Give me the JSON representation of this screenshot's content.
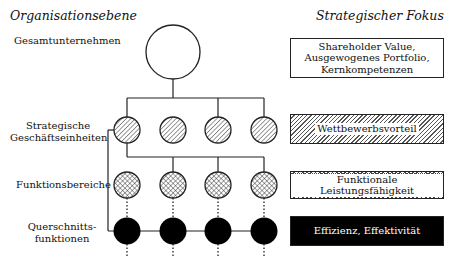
{
  "headings": {
    "left": "Organisationsebene",
    "right": "Strategischer Fokus"
  },
  "levels": [
    {
      "label": "Gesamtunternehmen",
      "fill": "white",
      "count": 1
    },
    {
      "label_line1": "Strategische",
      "label_line2": "Geschäftseinheiten",
      "fill": "diagonal-hatch",
      "count": 4
    },
    {
      "label": "Funktionsbereiche",
      "fill": "cross-hatch",
      "count": 4
    },
    {
      "label_line1": "Querschnitts-",
      "label_line2": "funktionen",
      "fill": "black",
      "count": 4
    }
  ],
  "focus_boxes": [
    {
      "line1": "Shareholder Value,",
      "line2": "Ausgewogenes Portfolio,",
      "line3": "Kernkompetenzen",
      "style": "white"
    },
    {
      "text": "Wettbewerbsvorteil",
      "style": "diagonal-hatch"
    },
    {
      "text": "Funktionale Leistungsfähigkeit",
      "style": "cross-hatch"
    },
    {
      "text": "Effizienz, Effektivität",
      "style": "black"
    }
  ],
  "colors": {
    "line": "#222222",
    "black_fill": "#000000",
    "background": "#ffffff"
  }
}
